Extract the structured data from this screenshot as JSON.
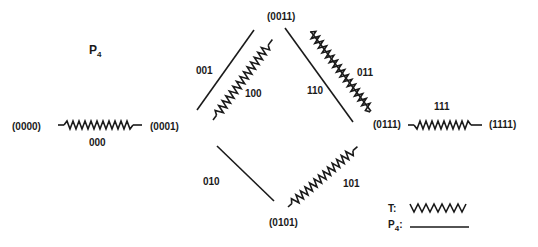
{
  "title": {
    "main": "P",
    "sub": "4"
  },
  "nodes": [
    {
      "id": "n0000",
      "label": "(0000)",
      "x": 12,
      "y": 122
    },
    {
      "id": "n0001",
      "label": "(0001)",
      "x": 150,
      "y": 122
    },
    {
      "id": "n0011",
      "label": "(0011)",
      "x": 267,
      "y": 12
    },
    {
      "id": "n0111",
      "label": "(0111)",
      "x": 373,
      "y": 122
    },
    {
      "id": "n1111",
      "label": "(1111)",
      "x": 489,
      "y": 122
    },
    {
      "id": "n0101",
      "label": "(0101)",
      "x": 269,
      "y": 218
    }
  ],
  "edges": [
    {
      "label": "000",
      "type": "T",
      "label_x": 89,
      "label_y": 138
    },
    {
      "label": "001",
      "type": "P4",
      "label_x": 196,
      "label_y": 66
    },
    {
      "label": "100",
      "type": "T",
      "label_x": 245,
      "label_y": 89
    },
    {
      "label": "110",
      "type": "P4",
      "label_x": 307,
      "label_y": 86
    },
    {
      "label": "011",
      "type": "T",
      "label_x": 357,
      "label_y": 68
    },
    {
      "label": "111",
      "type": "T",
      "label_x": 434,
      "label_y": 102
    },
    {
      "label": "010",
      "type": "P4",
      "label_x": 203,
      "label_y": 177
    },
    {
      "label": "101",
      "type": "T",
      "label_x": 343,
      "label_y": 179
    }
  ],
  "legend": {
    "items": [
      {
        "label": "T:",
        "style": "wavy"
      },
      {
        "label": "P",
        "sub": "4",
        "suffix": ":",
        "style": "solid"
      }
    ]
  },
  "colors": {
    "ink": "#1a1a1a",
    "background": "#ffffff"
  }
}
